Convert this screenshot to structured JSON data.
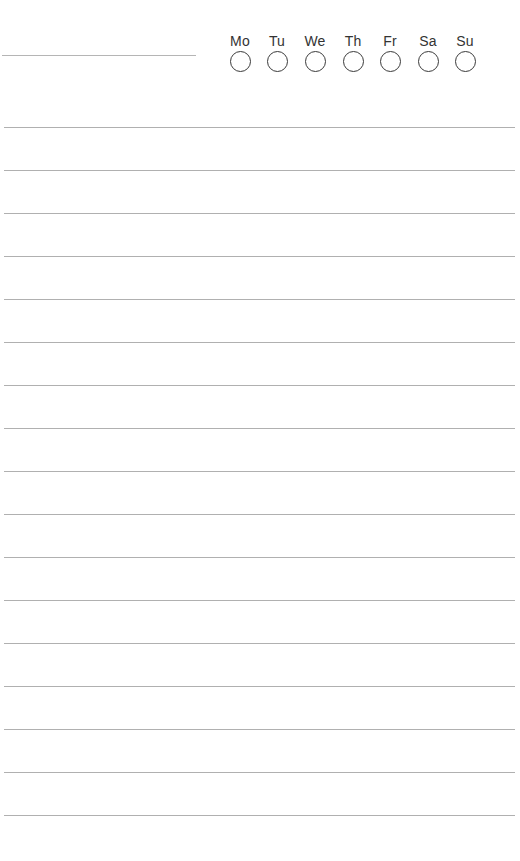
{
  "page": {
    "type": "lined-notepad-habit-page",
    "background_color": "#ffffff",
    "line_color": "#b0b0b0"
  },
  "header": {
    "title_line": "",
    "days": [
      {
        "label": "Mo",
        "checked": false
      },
      {
        "label": "Tu",
        "checked": false
      },
      {
        "label": "We",
        "checked": false
      },
      {
        "label": "Th",
        "checked": false
      },
      {
        "label": "Fr",
        "checked": false
      },
      {
        "label": "Sa",
        "checked": false
      },
      {
        "label": "Su",
        "checked": false
      }
    ]
  },
  "lines": {
    "count": 17,
    "first_y": 127,
    "spacing": 43
  }
}
